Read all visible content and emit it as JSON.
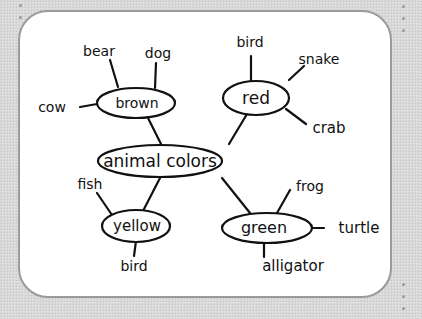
{
  "diagram": {
    "type": "concept-map",
    "center": {
      "label": "animal colors"
    },
    "branches": [
      {
        "color": "brown",
        "animals": [
          "bear",
          "dog",
          "cow"
        ]
      },
      {
        "color": "red",
        "animals": [
          "bird",
          "snake",
          "crab"
        ]
      },
      {
        "color": "yellow",
        "animals": [
          "fish",
          "bird"
        ]
      },
      {
        "color": "green",
        "animals": [
          "frog",
          "turtle",
          "alligator"
        ]
      }
    ]
  }
}
